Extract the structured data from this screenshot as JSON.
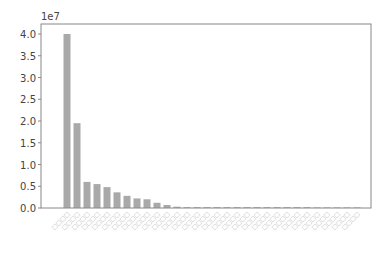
{
  "chart_data": {
    "type": "bar",
    "title": "",
    "xlabel": "",
    "ylabel": "",
    "y_offset_label": "1e7",
    "ylim": [
      0,
      4.2
    ],
    "yticks": [
      "0.0",
      "0.5",
      "1.0",
      "1.5",
      "2.0",
      "2.5",
      "3.0",
      "3.5",
      "4.0"
    ],
    "grid": false,
    "bar_color": "#a9a9a9",
    "categories": [
      "□□□□",
      "□□□□",
      "□□□□",
      "□□□□",
      "□□□□",
      "□□□□",
      "□□□□",
      "□□□□",
      "□□□□",
      "□□□□",
      "□□□□",
      "□□□□",
      "□□□□",
      "□□□□",
      "□□□□",
      "□□□□",
      "□□□□",
      "□□□□",
      "□□□□",
      "□□□□",
      "□□□□",
      "□□□□",
      "□□□□",
      "□□□□",
      "□□□□",
      "□□□□",
      "□□□□",
      "□□□□",
      "□□□□",
      "□□□□"
    ],
    "values": [
      4.0,
      1.95,
      0.6,
      0.55,
      0.48,
      0.36,
      0.28,
      0.22,
      0.2,
      0.12,
      0.07,
      0.03,
      0.02,
      0.02,
      0.02,
      0.02,
      0.02,
      0.02,
      0.02,
      0.02,
      0.02,
      0.02,
      0.02,
      0.02,
      0.02,
      0.01,
      0.01,
      0.005,
      0.005,
      0.005
    ]
  }
}
